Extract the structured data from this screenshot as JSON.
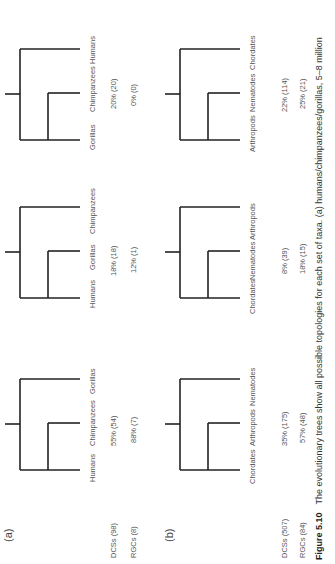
{
  "figure": {
    "panel_a_label": "(a)",
    "panel_b_label": "(b)",
    "caption_label": "Figure 5.10",
    "caption_text": "The evolutionary trees show all possible topologies for each set of taxa. (a) humans/chimpanzees/gorillas, 5–8 million"
  },
  "panel_a": {
    "row_labels": {
      "dcs": "DCSs (98)",
      "rgc": "RGCs (8)"
    },
    "trees": [
      {
        "taxa": [
          "Humans",
          "Chimpanzees",
          "Gorillas"
        ],
        "dcs": "55% (54)",
        "rgc": "88% (7)"
      },
      {
        "taxa": [
          "Humans",
          "Gorillas",
          "Chimpanzees"
        ],
        "dcs": "18% (18)",
        "rgc": "12% (1)"
      },
      {
        "taxa": [
          "Gorillas",
          "Chimpanzees",
          "Humans"
        ],
        "dcs": "20% (20)",
        "rgc": "0% (0)"
      }
    ]
  },
  "panel_b": {
    "row_labels": {
      "dcs": "DCSs (507)",
      "rgc": "RGCs (84)"
    },
    "trees": [
      {
        "taxa": [
          "Chordates",
          "Arthropods",
          "Nematodes"
        ],
        "dcs": "35% (175)",
        "rgc": "57% (48)"
      },
      {
        "taxa": [
          "Chordates",
          "Nematodes",
          "Arthropods"
        ],
        "dcs": "8% (39)",
        "rgc": "18% (15)"
      },
      {
        "taxa": [
          "Arthropods",
          "Nematodes",
          "Chordates"
        ],
        "dcs": "22% (114)",
        "rgc": "25% (21)"
      }
    ]
  }
}
